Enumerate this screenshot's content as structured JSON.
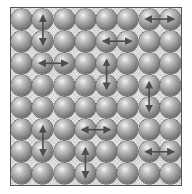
{
  "diagram": {
    "title": "",
    "grid": {
      "rows": 8,
      "cols": 8
    },
    "frame": {
      "left": 11,
      "top": 8,
      "width": 170,
      "height": 177
    },
    "colors": {
      "background": "#ffffff",
      "frame_border": "#555555",
      "lattice_fill": "#e4e4e4",
      "sphere_highlight": "#f4f4f4",
      "sphere_shadow": "#4a4a4a",
      "arrow": "#4d4d4d"
    },
    "element": "sphere",
    "swaps": [
      {
        "orientation": "vertical",
        "row": 1,
        "col": 2,
        "row2": 2,
        "col2": 2
      },
      {
        "orientation": "horizontal",
        "row": 1,
        "col": 7,
        "row2": 1,
        "col2": 8
      },
      {
        "orientation": "horizontal",
        "row": 2,
        "col": 5,
        "row2": 2,
        "col2": 6
      },
      {
        "orientation": "horizontal",
        "row": 3,
        "col": 2,
        "row2": 3,
        "col2": 3
      },
      {
        "orientation": "vertical",
        "row": 3,
        "col": 5,
        "row2": 4,
        "col2": 5
      },
      {
        "orientation": "vertical",
        "row": 4,
        "col": 7,
        "row2": 5,
        "col2": 7
      },
      {
        "orientation": "vertical",
        "row": 6,
        "col": 2,
        "row2": 7,
        "col2": 2
      },
      {
        "orientation": "horizontal",
        "row": 6,
        "col": 4,
        "row2": 6,
        "col2": 5
      },
      {
        "orientation": "vertical",
        "row": 7,
        "col": 4,
        "row2": 8,
        "col2": 4
      },
      {
        "orientation": "horizontal",
        "row": 7,
        "col": 7,
        "row2": 7,
        "col2": 8
      }
    ]
  }
}
